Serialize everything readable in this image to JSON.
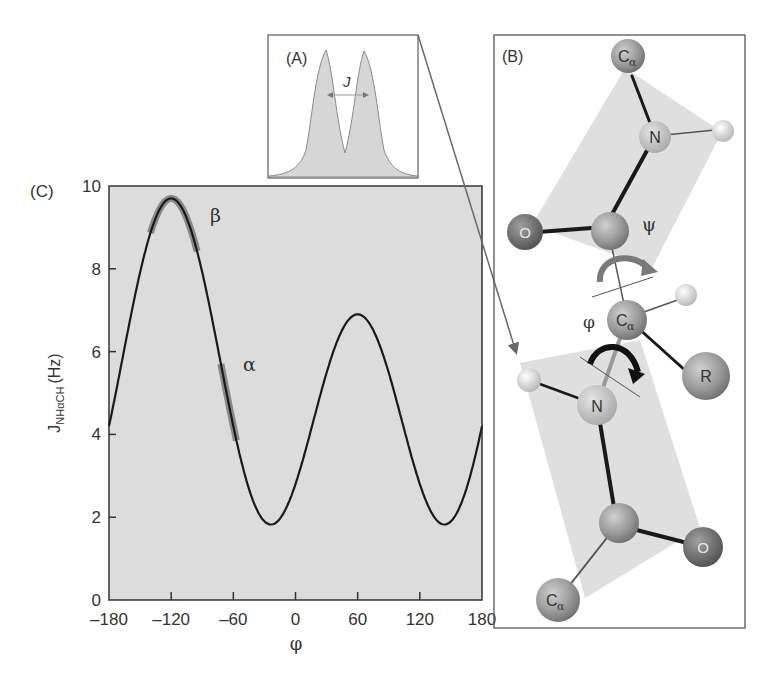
{
  "panels": {
    "A": {
      "label": "(A)",
      "j_label": "J",
      "caption": "doublet splitting"
    },
    "B": {
      "label": "(B)",
      "atoms": {
        "ca_top": "Cα",
        "n_top": "N",
        "o_left": "O",
        "ca_mid": "Cα",
        "r": "R",
        "n_bottom": "N",
        "o_right": "O",
        "ca_bottom": "Cα"
      },
      "angles": {
        "psi": "ψ",
        "phi": "φ"
      }
    },
    "C": {
      "label": "(C)"
    }
  },
  "colors": {
    "plot_bg": "#dcdcdc",
    "curve": "#1a1a1a",
    "highlight": "#7a7a7a",
    "plane": "#d8d8d8",
    "atom": "#9a9a9a",
    "frame": "#555555"
  },
  "chart_data": {
    "type": "line",
    "title": "",
    "xlabel": "φ",
    "ylabel": "J_NHαCH (Hz)",
    "ylabel_main": "J",
    "ylabel_sub": "NHαCH",
    "ylabel_unit": "(Hz)",
    "xlim": [
      -180,
      180
    ],
    "ylim": [
      0,
      10
    ],
    "xticks": [
      -180,
      -120,
      -60,
      0,
      60,
      120,
      180
    ],
    "xtick_labels": [
      "–180",
      "–120",
      "–60",
      "0",
      "60",
      "120",
      "180"
    ],
    "yticks": [
      0,
      2,
      4,
      6,
      8,
      10
    ],
    "ytick_labels": [
      "0",
      "2",
      "4",
      "6",
      "8",
      "10"
    ],
    "grid": false,
    "karplus": {
      "A": 6.4,
      "B": -1.4,
      "C": 1.9,
      "theta_offset": -60
    },
    "x": [
      -180,
      -150,
      -120,
      -115,
      -90,
      -60,
      -30,
      -20,
      0,
      30,
      60,
      90,
      120,
      140,
      180
    ],
    "values": [
      4.2,
      7.6,
      9.5,
      9.5,
      8.3,
      4.5,
      1.7,
      1.5,
      2.3,
      5.1,
      6.8,
      5.1,
      2.3,
      1.9,
      4.2
    ],
    "annotations": [
      {
        "text": "β",
        "phi_range": [
          -140,
          -95
        ],
        "note": "β-sheet region"
      },
      {
        "text": "α",
        "phi_range": [
          -72,
          -57
        ],
        "note": "α-helix region"
      }
    ]
  }
}
